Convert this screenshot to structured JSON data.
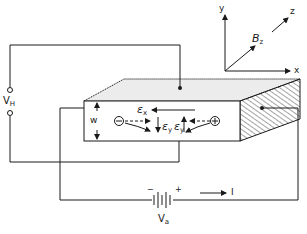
{
  "figure": {
    "type": "hall-effect-experiment",
    "colors": {
      "ink": "#1a1a1a",
      "top_face": "#ececec",
      "background": "#ffffff"
    }
  },
  "axes": {
    "x_label": "x",
    "y_label": "y",
    "z_label": "z",
    "field_symbol": "B",
    "field_sub": "z"
  },
  "sample": {
    "width_label": "w",
    "field_x_symbol": "ε",
    "field_x_sub": "x",
    "field_y_symbol": "ε",
    "field_y_sub": "y",
    "electron_symbol": "⊖",
    "hole_symbol": "⊕"
  },
  "hall_voltage": {
    "symbol": "V",
    "sub": "H"
  },
  "battery": {
    "symbol": "V",
    "sub": "a",
    "minus": "−",
    "plus": "+"
  },
  "current": {
    "label": "I"
  }
}
